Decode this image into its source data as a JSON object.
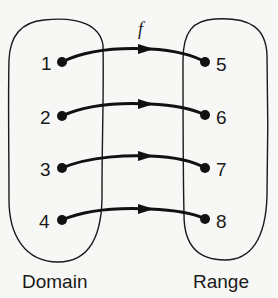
{
  "diagram": {
    "function_label": "f",
    "domain": {
      "label": "Domain",
      "elements": [
        "1",
        "2",
        "3",
        "4"
      ]
    },
    "range": {
      "label": "Range",
      "elements": [
        "5",
        "6",
        "7",
        "8"
      ]
    },
    "mappings": [
      {
        "from": "1",
        "to": "5"
      },
      {
        "from": "2",
        "to": "6"
      },
      {
        "from": "3",
        "to": "7"
      },
      {
        "from": "4",
        "to": "8"
      }
    ],
    "colors": {
      "background": "#f7f7f5",
      "stroke": "#1a1a1a"
    }
  }
}
